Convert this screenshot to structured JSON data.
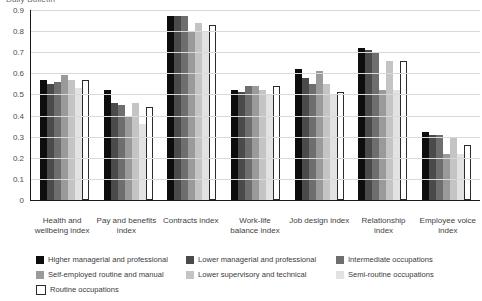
{
  "chart_data": {
    "type": "bar",
    "title": "Daily Bulletin",
    "xlabel": "",
    "ylabel": "",
    "ylim": [
      0,
      0.9
    ],
    "grid": true,
    "legend_position": "bottom",
    "y_ticks": [
      "0.9",
      "0.8",
      "0.7",
      "0.6",
      "0.5",
      "0.4",
      "0.3",
      "0.2",
      "0.1",
      "0"
    ],
    "y_tick_values": [
      0.9,
      0.8,
      0.7,
      0.6,
      0.5,
      0.4,
      0.3,
      0.2,
      0.1,
      0
    ],
    "categories": [
      "Health and wellbeing index",
      "Pay and benefits index",
      "Contracts index",
      "Work-life balance index",
      "Job design index",
      "Relationship index",
      "Employee voice index"
    ],
    "series": [
      {
        "name": "Higher  managerial and professional",
        "color": "#0d0d0d",
        "values": [
          0.57,
          0.52,
          0.87,
          0.52,
          0.62,
          0.72,
          0.32
        ]
      },
      {
        "name": "Lower  managerial and professional",
        "color": "#4a4a4a",
        "values": [
          0.55,
          0.46,
          0.87,
          0.51,
          0.58,
          0.71,
          0.31
        ]
      },
      {
        "name": "Intermediate occupations",
        "color": "#6e6e6e",
        "values": [
          0.56,
          0.45,
          0.87,
          0.54,
          0.55,
          0.7,
          0.31
        ]
      },
      {
        "name": "Self-employed routine and manual",
        "color": "#9a9a9a",
        "values": [
          0.59,
          0.4,
          0.8,
          0.54,
          0.61,
          0.52,
          0.22
        ]
      },
      {
        "name": "Lower supervisory and technical",
        "color": "#c4c4c4",
        "values": [
          0.57,
          0.46,
          0.84,
          0.52,
          0.55,
          0.66,
          0.3
        ]
      },
      {
        "name": "Semi-routine occupations",
        "color": "#e2e2e2",
        "values": [
          0.53,
          0.36,
          0.8,
          0.5,
          0.5,
          0.52,
          0.22
        ]
      },
      {
        "name": "Routine occupations",
        "color": "#ffffff",
        "values": [
          0.57,
          0.44,
          0.83,
          0.54,
          0.51,
          0.66,
          0.26
        ]
      }
    ]
  }
}
